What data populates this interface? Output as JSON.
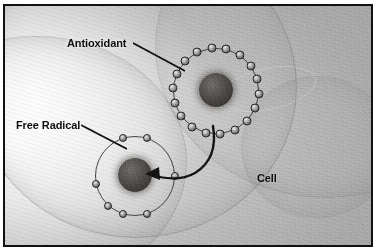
{
  "figure": {
    "border_color": "#111111",
    "background_color": "#b9b9b9"
  },
  "labels": {
    "antioxidant": "Antioxidant",
    "free_radical": "Free Radical",
    "cell": "Cell"
  },
  "diagram": {
    "antioxidant": {
      "name": "antioxidant",
      "electron_count": 18,
      "nucleus_color": "#46423f",
      "electron_color": "#7d7d7d",
      "orbit_color": "#3a3a3a",
      "center_x": 211,
      "center_y": 85,
      "radius": 43
    },
    "free_radical": {
      "name": "free-radical",
      "electron_count": 7,
      "nucleus_color": "#46423f",
      "electron_color": "#7d7d7d",
      "orbit_color": "#3a3a3a",
      "center_x": 130,
      "center_y": 170,
      "radius": 40
    },
    "arrow": {
      "name": "donation-arrow",
      "from": "antioxidant",
      "to": "free_radical",
      "color": "#121212",
      "style": "curved-solid-with-head"
    },
    "leader_lines": [
      {
        "name": "antioxidant-leader",
        "from_label": "Antioxidant",
        "to": "antioxidant"
      },
      {
        "name": "free-radical-leader",
        "from_label": "Free Radical",
        "to": "free_radical"
      }
    ]
  }
}
